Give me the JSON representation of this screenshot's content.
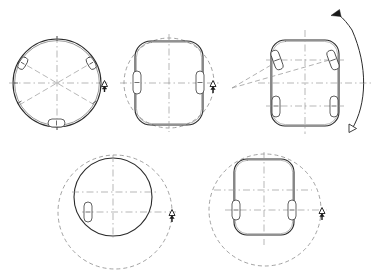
{
  "figure": {
    "title": "",
    "background_color": "#ffffff",
    "line_color": "#1a1a1a",
    "dashed_color": "#8a8a8a",
    "centerline_color": "#9a9a9a",
    "width": 372,
    "height": 280,
    "panel_count": 5
  },
  "panels": [
    {
      "id": "panel-1",
      "name": "circular-platform-three-wheels",
      "shape": "circle",
      "center": [
        57,
        83
      ],
      "radius": 44,
      "wheel_count": 3,
      "wheel_angles_deg": [
        60,
        120,
        270
      ],
      "radii_lines_deg": [
        0,
        60,
        120,
        180,
        240,
        300
      ],
      "heading_marker": "up-triangle",
      "heading_marker_pos": [
        104,
        83
      ]
    },
    {
      "id": "panel-2",
      "name": "rounded-body-in-circle",
      "shape": "rounded-rect-in-dashed-circle",
      "center": [
        169,
        83
      ],
      "circle_radius": 45,
      "body_width": 68,
      "body_height": 84,
      "corner_radius": 16,
      "wheel_count": 2,
      "wheel_positions": [
        "left-mid",
        "right-mid"
      ],
      "heading_marker": "up-triangle",
      "heading_marker_pos": [
        213,
        83
      ]
    },
    {
      "id": "panel-3",
      "name": "steered-body-turn-radius",
      "shape": "rounded-rect-steered",
      "center": [
        305,
        83
      ],
      "body_width": 68,
      "body_height": 86,
      "corner_radius": 14,
      "wheel_count": 4,
      "front_wheels_steered": true,
      "front_steer_angle_deg": 20,
      "rear_wheels_steered": false,
      "instant_center": [
        232,
        88
      ],
      "turn_arc": "right-side-curved-arrow",
      "arrow_direction": "counter-clockwise-up",
      "arrow_head_pos": [
        355,
        14
      ],
      "open_marker_pos": [
        352,
        128
      ]
    },
    {
      "id": "panel-4",
      "name": "circular-platform-offset-rotation",
      "shape": "circle-offset-in-dashed-circle",
      "body_center": [
        113,
        197
      ],
      "body_radius": 39,
      "path_center": [
        115,
        212
      ],
      "path_radius": 57,
      "wheel_count": 1,
      "wheel_position": "lower-left",
      "heading_marker": "up-triangle",
      "heading_marker_pos": [
        172,
        212
      ]
    },
    {
      "id": "panel-5",
      "name": "rounded-body-offset-rotation",
      "shape": "rounded-rect-offset-in-dashed-circle",
      "body_center": [
        264,
        197
      ],
      "body_width": 60,
      "body_height": 76,
      "corner_radius": 13,
      "path_center": [
        265,
        210
      ],
      "path_radius": 56,
      "wheel_count": 2,
      "wheel_positions": [
        "left-lower",
        "right-lower"
      ],
      "heading_marker": "up-triangle",
      "heading_marker_pos": [
        322,
        210
      ]
    }
  ],
  "legend": {
    "wheel_label": "",
    "marker_label": "",
    "notes": ""
  }
}
